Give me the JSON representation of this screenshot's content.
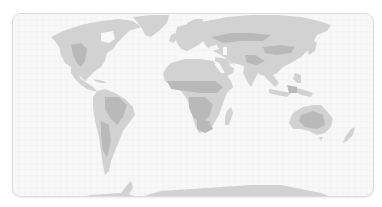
{
  "map": {
    "type": "world-map",
    "style": "grayscale",
    "colors": {
      "background": "#f8f8f8",
      "border": "#dcdcdc",
      "land": "#d2d2d2",
      "land_dark": "#b9b9b9"
    },
    "land": [
      {
        "name": "north-america",
        "points": "50,36 62,30 80,24 100,20 118,18 132,20 140,26 128,30 122,36 116,42 112,48 106,52 104,60 100,66 94,70 88,76 84,80 80,76 74,72 70,66 64,62 60,54 58,46 54,40"
      },
      {
        "name": "greenland",
        "points": "132,16 150,14 168,14 166,22 158,30 150,36 144,34 140,26"
      },
      {
        "name": "central-america",
        "points": "70,66 76,72 80,78 86,82 92,86 96,90 92,90 86,88 80,84 74,78 70,72"
      },
      {
        "name": "caribbean",
        "points": "92,78 102,80 106,82 100,82 94,80"
      },
      {
        "name": "south-america",
        "points": "96,90 104,88 114,92 124,98 132,106 134,114 128,122 122,130 118,140 114,150 110,160 108,170 104,174 102,164 100,150 98,136 94,120 92,106 92,96"
      },
      {
        "name": "europe",
        "points": "176,26 190,22 206,20 214,24 210,30 206,36 200,42 194,46 186,50 180,48 176,42 174,36"
      },
      {
        "name": "uk",
        "points": "170,34 174,32 176,38 172,42 168,40"
      },
      {
        "name": "scandinavia",
        "points": "186,22 194,18 202,18 200,26 194,30 188,30"
      },
      {
        "name": "asia",
        "points": "206,20 226,16 250,14 276,14 300,16 318,20 330,24 326,30 316,34 312,42 306,50 300,56 290,62 282,66 276,72 268,76 260,74 254,70 248,68 240,64 232,62 226,58 220,54 212,50 206,46 202,40 204,30"
      },
      {
        "name": "arabia",
        "points": "214,56 226,58 234,64 232,72 224,76 218,70 214,62"
      },
      {
        "name": "india",
        "points": "244,62 254,64 258,70 254,78 250,86 246,80 242,72"
      },
      {
        "name": "southeast-asia",
        "points": "262,70 272,74 278,82 274,86 268,80 264,76"
      },
      {
        "name": "japan",
        "points": "310,38 316,42 314,50 308,54 306,48"
      },
      {
        "name": "indonesia-1",
        "points": "268,88 280,90 290,92 286,96 276,94 268,92"
      },
      {
        "name": "indonesia-2",
        "points": "290,86 300,88 312,92 310,96 300,94 292,90"
      },
      {
        "name": "philippines",
        "points": "294,72 300,74 300,82 296,82 292,78"
      },
      {
        "name": "africa",
        "points": "170,62 184,58 200,58 212,60 218,66 224,72 230,80 232,86 226,92 222,102 218,114 212,124 206,130 198,132 194,124 190,110 186,98 180,90 172,86 164,80 162,72 166,66"
      },
      {
        "name": "madagascar",
        "points": "226,110 230,106 232,112 228,124 224,124 224,116"
      },
      {
        "name": "australia",
        "points": "292,112 302,106 312,104 320,104 326,110 332,118 330,126 324,132 316,134 308,130 300,128 292,128 288,122 290,116"
      },
      {
        "name": "tasmania",
        "points": "318,136 322,136 320,140"
      },
      {
        "name": "new-zealand",
        "points": "350,128 354,126 352,134 346,140 342,142 344,136"
      },
      {
        "name": "antarctica",
        "points": "60,200 90,194 120,192 140,196 160,190 190,188 220,186 250,184 280,184 300,188 320,192 330,196 330,207 60,207"
      },
      {
        "name": "antarctic-peninsula",
        "points": "120,192 126,184 130,180 132,186 128,194"
      }
    ],
    "darker_regions": [
      {
        "name": "us-plains",
        "points": "70,44 80,42 86,48 84,60 80,66 76,62 72,54"
      },
      {
        "name": "amazon",
        "points": "104,96 118,96 126,104 122,116 116,124 110,118 104,108"
      },
      {
        "name": "andes",
        "points": "100,120 108,124 110,140 106,156 102,150 100,134"
      },
      {
        "name": "sahel",
        "points": "166,80 180,80 200,80 214,80 222,86 216,92 200,92 184,90 170,88"
      },
      {
        "name": "central-africa",
        "points": "188,96 204,96 212,104 208,116 200,122 192,116 188,106"
      },
      {
        "name": "southern-africa",
        "points": "196,118 208,120 212,128 204,132 196,128"
      },
      {
        "name": "russia-band",
        "points": "210,36 230,32 250,32 270,34 262,40 240,40 222,42"
      },
      {
        "name": "central-asia",
        "points": "262,46 280,44 294,46 290,52 276,54 264,52"
      },
      {
        "name": "himalaya",
        "points": "244,54 254,54 264,60 256,64 246,62"
      },
      {
        "name": "australia-interior",
        "points": "300,114 312,110 322,114 324,124 316,128 304,126 298,120"
      },
      {
        "name": "borneo",
        "points": "286,84 296,86 296,92 288,92"
      }
    ],
    "lakes": [
      {
        "name": "hudson-bay",
        "points": "100,32 112,30 114,38 108,42 100,40"
      },
      {
        "name": "mediterranean",
        "points": "180,52 194,50 206,52 210,56 198,58 186,58 178,56"
      },
      {
        "name": "black-sea",
        "points": "208,46 216,44 218,48 210,50"
      },
      {
        "name": "caspian",
        "points": "222,46 226,46 226,54 222,54"
      },
      {
        "name": "red-sea",
        "points": "214,60 218,62 224,72 220,72 214,64"
      },
      {
        "name": "persian-gulf",
        "points": "228,62 234,64 236,68 230,66"
      }
    ]
  }
}
